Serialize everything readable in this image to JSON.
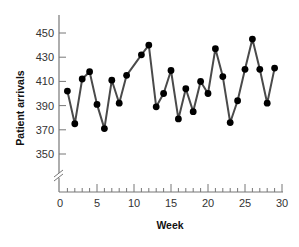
{
  "chart_data": {
    "type": "line",
    "title": "",
    "xlabel": "Week",
    "ylabel": "Patient arrivals",
    "xlim": [
      0,
      30
    ],
    "ylim": [
      330,
      460
    ],
    "x_ticks": [
      0,
      5,
      10,
      15,
      20,
      25,
      30
    ],
    "x_minor_step": 1,
    "y_ticks": [
      350,
      370,
      390,
      410,
      430,
      450
    ],
    "y_axis_break": true,
    "grid": false,
    "legend": "none",
    "series": [
      {
        "name": "Patient arrivals",
        "color": "#4a4a4a",
        "marker_color": "#000000",
        "x": [
          1,
          2,
          3,
          4,
          5,
          6,
          7,
          8,
          9,
          11,
          12,
          13,
          14,
          15,
          16,
          17,
          18,
          19,
          20,
          21,
          22,
          23,
          24,
          25,
          26,
          27,
          28,
          29
        ],
        "values": [
          402,
          375,
          412,
          418,
          391,
          371,
          411,
          392,
          415,
          432,
          440,
          389,
          400,
          419,
          379,
          404,
          385,
          410,
          400,
          437,
          414,
          376,
          394,
          420,
          445,
          420,
          392,
          421
        ]
      }
    ]
  }
}
